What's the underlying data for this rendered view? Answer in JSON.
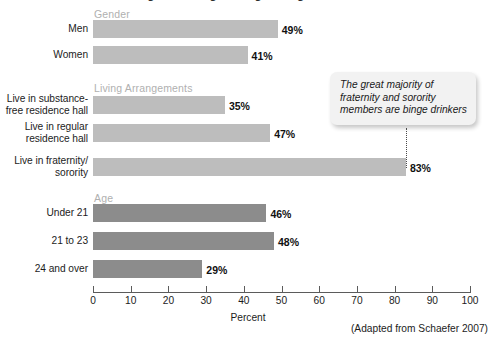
{
  "figure": {
    "cropped_title": "Binge Drinking among College Students",
    "axis_title": "Percent",
    "source_note": "(Adapted from Schaefer 2007)",
    "callout_text": "The great majority of fraternity and sorority members are binge drinkers",
    "colors": {
      "bar_light": "#bdbdbd",
      "bar_dark": "#8c8c8c",
      "group_header": "#b0b0b0",
      "axis": "#5b5b5b",
      "callout_background": "#f2f2f2"
    }
  },
  "chart_data": {
    "type": "bar",
    "orientation": "horizontal",
    "title": "Binge Drinking among College Students",
    "xlabel": "Percent",
    "ylabel": "",
    "xlim": [
      0,
      100
    ],
    "grid": false,
    "legend": "none",
    "value_suffix": "%",
    "annotations": [
      {
        "text": "The great majority of fraternity and sorority members are binge drinkers",
        "points_to": "Live in fraternity/sorority",
        "style": "rounded-callout-with-dotted-leader"
      },
      {
        "text": "(Adapted from Schaefer 2007)",
        "style": "source-note"
      }
    ],
    "tick_labels": [
      "0",
      "10",
      "20",
      "30",
      "40",
      "50",
      "60",
      "70",
      "80",
      "90",
      "100"
    ],
    "ticks": [
      0,
      10,
      20,
      30,
      40,
      50,
      60,
      70,
      80,
      90,
      100
    ],
    "groups": [
      {
        "header": "Gender",
        "shade": "light",
        "categories": [
          "Men",
          "Women"
        ],
        "values": [
          49,
          41
        ],
        "labels": [
          "49%",
          "41%"
        ]
      },
      {
        "header": "Living Arrangements",
        "shade": "light",
        "categories": [
          "Live in substance-\nfree residence hall",
          "Live in regular\nresidence hall",
          "Live in fraternity/\nsorority"
        ],
        "values": [
          35,
          47,
          83
        ],
        "labels": [
          "35%",
          "47%",
          "83%"
        ]
      },
      {
        "header": "Age",
        "shade": "dark",
        "categories": [
          "Under 21",
          "21 to 23",
          "24 and over"
        ],
        "values": [
          46,
          48,
          29
        ],
        "labels": [
          "46%",
          "48%",
          "29%"
        ]
      }
    ]
  }
}
